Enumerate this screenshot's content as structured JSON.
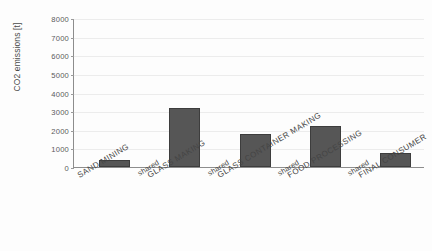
{
  "chart_data": {
    "type": "bar",
    "title": "",
    "xlabel": "",
    "ylabel": "CO2 emissions [t]",
    "ylim": [
      0,
      8000
    ],
    "ytick_step": 1000,
    "yticks": [
      "0",
      "1000",
      "2000",
      "3000",
      "4000",
      "5000",
      "6000",
      "7000",
      "8000"
    ],
    "grid": true,
    "legend": "none",
    "categories": [
      "SAND MINING",
      "GLASS MAKING",
      "GLASS CONTAINER MAKING",
      "FOOD PROCESSING",
      "FINAL CONSUMER"
    ],
    "values": [
      400,
      3150,
      1780,
      2220,
      760
    ],
    "separator_labels": [
      "shared",
      "shared",
      "shared",
      "shared"
    ],
    "xtick_labels_in_order": [
      "SAND MINING",
      "shared",
      "GLASS MAKING",
      "shared",
      "GLASS CONTAINER MAKING",
      "shared",
      "FOOD PROCESSING",
      "shared",
      "FINAL CONSUMER"
    ],
    "bar_color": "#565656",
    "bar_edge_color": "#3d3d3d",
    "axis_color": "#8d8d8d",
    "gridline_color": "#ececec",
    "background": "#fdfdfd"
  }
}
